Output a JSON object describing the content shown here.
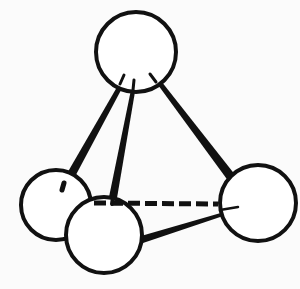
{
  "diagram": {
    "type": "ball-and-stick molecular geometry",
    "colors": {
      "stroke": "#111111",
      "fill": "#ffffff",
      "background": "#fbfbfb"
    },
    "atoms": [
      {
        "id": "apex",
        "cx": 136,
        "cy": 52,
        "r": 40
      },
      {
        "id": "base-left",
        "cx": 56,
        "cy": 205,
        "r": 35
      },
      {
        "id": "base-front",
        "cx": 104,
        "cy": 235,
        "r": 38
      },
      {
        "id": "base-right",
        "cx": 258,
        "cy": 203,
        "r": 38
      }
    ],
    "bonds": [
      {
        "from": "apex",
        "to": "base-left",
        "style": "wedge"
      },
      {
        "from": "apex",
        "to": "base-front",
        "style": "wedge"
      },
      {
        "from": "apex",
        "to": "base-right",
        "style": "wedge"
      },
      {
        "from": "base-front",
        "to": "base-right",
        "style": "wedge"
      },
      {
        "from": "base-front",
        "to": "base-right",
        "style": "dashed"
      }
    ]
  }
}
